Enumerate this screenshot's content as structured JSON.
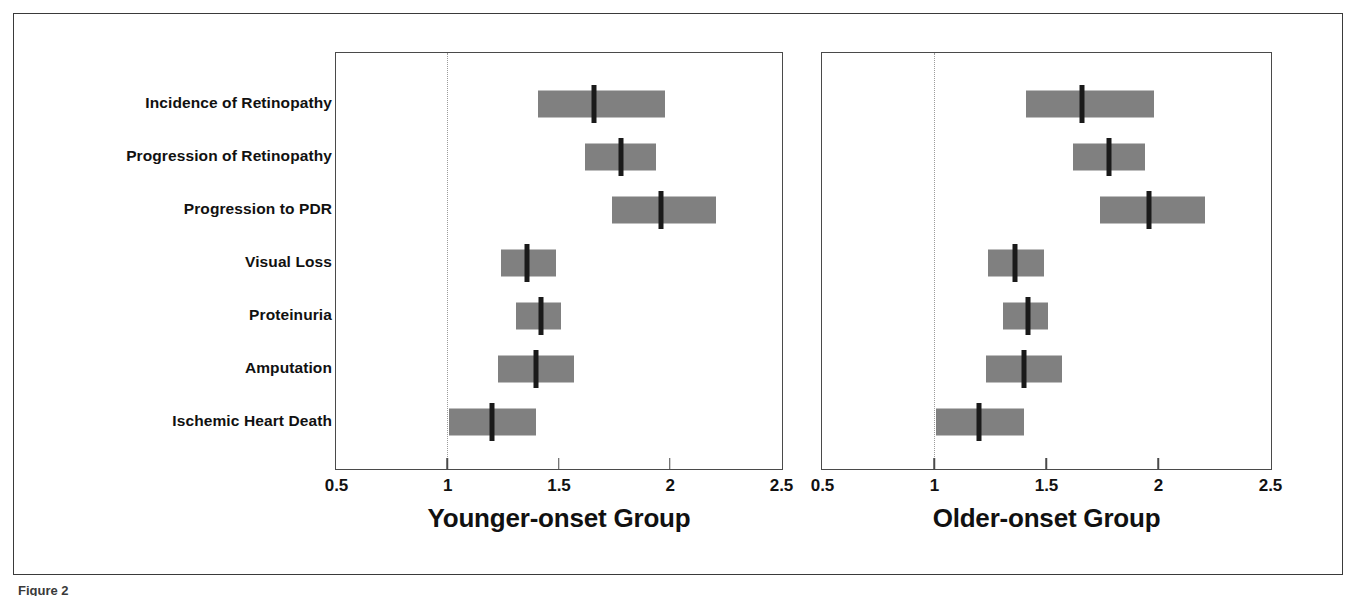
{
  "figure": {
    "caption_fragment": "Figure 2"
  },
  "chart_data": {
    "type": "bar",
    "chart_kind": "forest-plot",
    "title": "",
    "xlabel": "",
    "ylabel": "",
    "xlim": [
      0.5,
      2.5
    ],
    "grid": false,
    "reference_line": 1,
    "legend": "none",
    "axis_ticks": [
      {
        "value": 0.5,
        "label": "0.5"
      },
      {
        "value": 1,
        "label": "1"
      },
      {
        "value": 1.5,
        "label": "1.5"
      },
      {
        "value": 2,
        "label": "2"
      },
      {
        "value": 2.5,
        "label": "2.5"
      }
    ],
    "categories": [
      "Incidence of Retinopathy",
      "Progression of Retinopathy",
      "Progression to PDR",
      "Visual Loss",
      "Proteinuria",
      "Amputation",
      "Ischemic Heart Death"
    ],
    "panels": [
      {
        "id": "younger",
        "title": "Younger-onset Group",
        "points": [
          {
            "category": "Incidence of Retinopathy",
            "estimate": 1.66,
            "low": 1.41,
            "high": 1.98
          },
          {
            "category": "Progression of Retinopathy",
            "estimate": 1.78,
            "low": 1.62,
            "high": 1.94
          },
          {
            "category": "Progression to PDR",
            "estimate": 1.96,
            "low": 1.74,
            "high": 2.21
          },
          {
            "category": "Visual Loss",
            "estimate": 1.36,
            "low": 1.24,
            "high": 1.49
          },
          {
            "category": "Proteinuria",
            "estimate": 1.42,
            "low": 1.31,
            "high": 1.51
          },
          {
            "category": "Amputation",
            "estimate": 1.4,
            "low": 1.23,
            "high": 1.57
          },
          {
            "category": "Ischemic Heart Death",
            "estimate": 1.2,
            "low": 1.01,
            "high": 1.4
          }
        ]
      },
      {
        "id": "older",
        "title": "Older-onset Group",
        "points": [
          {
            "category": "Incidence of Retinopathy",
            "estimate": 1.66,
            "low": 1.41,
            "high": 1.98
          },
          {
            "category": "Progression of Retinopathy",
            "estimate": 1.78,
            "low": 1.62,
            "high": 1.94
          },
          {
            "category": "Progression to PDR",
            "estimate": 1.96,
            "low": 1.74,
            "high": 2.21
          },
          {
            "category": "Visual Loss",
            "estimate": 1.36,
            "low": 1.24,
            "high": 1.49
          },
          {
            "category": "Proteinuria",
            "estimate": 1.42,
            "low": 1.31,
            "high": 1.51
          },
          {
            "category": "Amputation",
            "estimate": 1.4,
            "low": 1.23,
            "high": 1.57
          },
          {
            "category": "Ischemic Heart Death",
            "estimate": 1.2,
            "low": 1.01,
            "high": 1.4
          }
        ]
      }
    ],
    "colors": {
      "bar_fill": "#808080",
      "point_estimate": "#1a1a1a",
      "axis": "#4a4a4a",
      "reference_line": "#9b9b9b",
      "text": "#111111",
      "background": "#ffffff"
    }
  }
}
